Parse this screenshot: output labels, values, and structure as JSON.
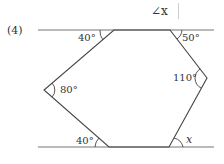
{
  "header": {
    "angle_prompt": "∠x"
  },
  "problem": {
    "number": "(4)"
  },
  "figure": {
    "line_color": "#555555",
    "parallel_lines": [
      {
        "name": "top-line",
        "y": 30,
        "x1": 38,
        "x2": 214
      },
      {
        "name": "bottom-line",
        "y": 147,
        "x1": 38,
        "x2": 214
      }
    ],
    "vertices": [
      {
        "name": "top-left",
        "x": 114,
        "y": 30
      },
      {
        "name": "top-right",
        "x": 170,
        "y": 30
      },
      {
        "name": "right",
        "x": 207,
        "y": 78
      },
      {
        "name": "bottom-right",
        "x": 169,
        "y": 147
      },
      {
        "name": "bottom-left",
        "x": 109,
        "y": 147
      },
      {
        "name": "left",
        "x": 44,
        "y": 90
      }
    ],
    "angles": {
      "top_left": "40°",
      "top_right": "50°",
      "right": "110°",
      "left": "80°",
      "bottom_left": "40°",
      "bottom_right": "x"
    }
  }
}
